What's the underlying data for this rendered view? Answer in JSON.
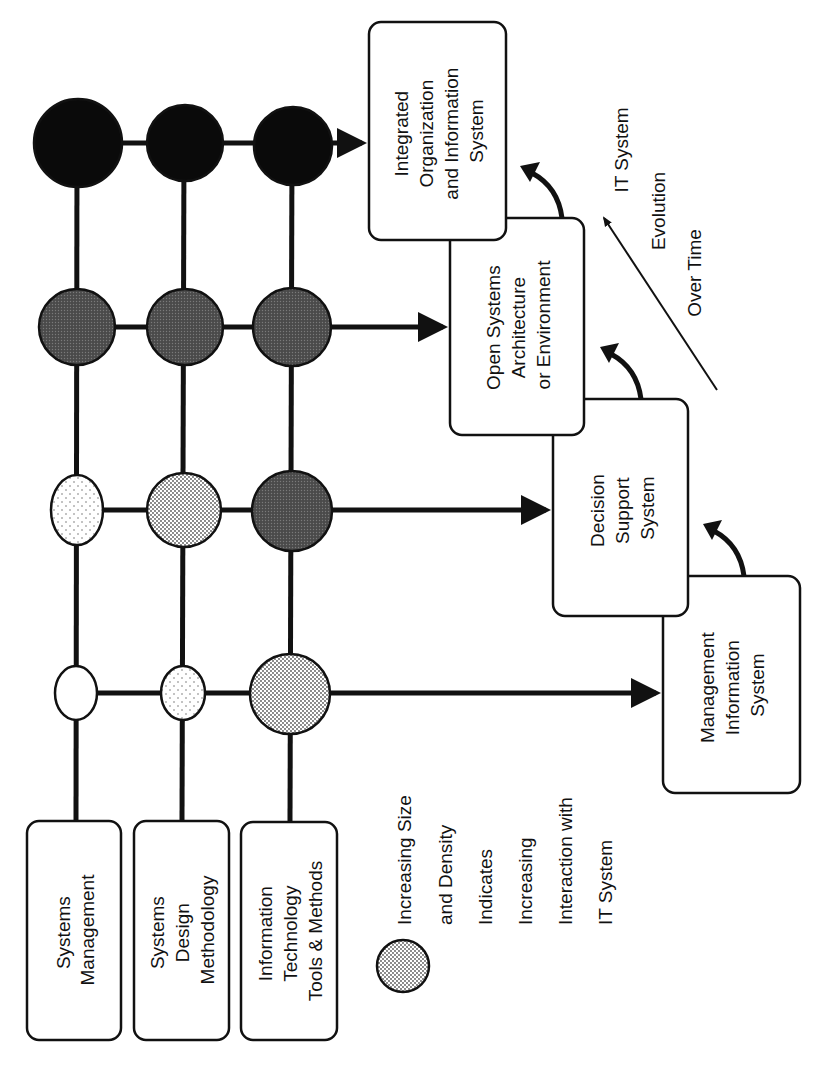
{
  "diagram": {
    "orientation": "rotated-90-ccw",
    "input_boxes": [
      {
        "id": "systems-management",
        "lines": [
          "Systems",
          "Management"
        ]
      },
      {
        "id": "systems-design-methodology",
        "lines": [
          "Systems",
          "Design",
          "Methodology"
        ]
      },
      {
        "id": "it-tools-methods",
        "lines": [
          "Information",
          "Technology",
          "Tools & Methods"
        ]
      }
    ],
    "stage_boxes": [
      {
        "id": "mis",
        "lines": [
          "Management",
          "Information",
          "System"
        ]
      },
      {
        "id": "dss",
        "lines": [
          "Decision",
          "Support",
          "System"
        ]
      },
      {
        "id": "open-systems",
        "lines": [
          "Open Systems",
          "Architecture",
          "or Environment"
        ]
      },
      {
        "id": "integrated",
        "lines": [
          "Integrated",
          "Organization",
          "and Information",
          "System"
        ]
      }
    ],
    "matrix": {
      "columns": [
        "Systems Management",
        "Systems Design Methodology",
        "Information Technology Tools & Methods"
      ],
      "rows": [
        {
          "stage": "Integrated Organization and Information System",
          "levels": [
            "black",
            "black",
            "black"
          ]
        },
        {
          "stage": "Open Systems Architecture or Environment",
          "levels": [
            "dark",
            "dark",
            "dark"
          ]
        },
        {
          "stage": "Decision Support System",
          "levels": [
            "light-sparse",
            "light",
            "dark"
          ]
        },
        {
          "stage": "Management Information System",
          "levels": [
            "white",
            "light-sparse",
            "light"
          ]
        }
      ]
    },
    "evolution_label": {
      "lines": [
        "IT System",
        "Evolution",
        "Over Time"
      ]
    },
    "legend": {
      "lines": [
        "Increasing Size",
        "and Density",
        "Indicates",
        "Increasing",
        "Interaction with",
        "IT System"
      ]
    },
    "colors": {
      "ink": "#111111",
      "black_fill": "#0a0a0a",
      "dark_fill": "#5a5a5a",
      "light_fill": "#d4d4d4",
      "sparse_fill": "#ececec",
      "white_fill": "#ffffff"
    }
  }
}
